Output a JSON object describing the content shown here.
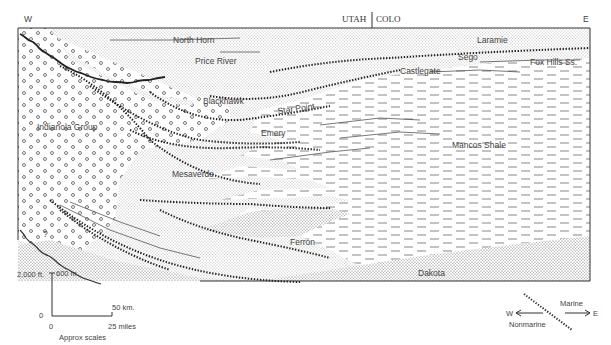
{
  "figure": {
    "type": "geologic-cross-section",
    "orientation": {
      "west_label": "W",
      "east_label": "E"
    },
    "state_boundary": {
      "left": "UTAH",
      "right": "COLO"
    }
  },
  "units": [
    {
      "name": "North Horn",
      "lithology": "sandstone-fine"
    },
    {
      "name": "Price River",
      "lithology": "sandstone-fine"
    },
    {
      "name": "Laramie",
      "lithology": "sandstone-fine"
    },
    {
      "name": "Sego",
      "lithology": "sandstone"
    },
    {
      "name": "Fox Hills Ss.",
      "lithology": "sandstone"
    },
    {
      "name": "Castlegate",
      "lithology": "sandstone"
    },
    {
      "name": "Blackhawk",
      "lithology": "sandstone"
    },
    {
      "name": "Star Point",
      "lithology": "sandstone"
    },
    {
      "name": "Emery",
      "lithology": "sandstone"
    },
    {
      "name": "Indianola Group",
      "lithology": "conglomerate"
    },
    {
      "name": "Mesaverde",
      "lithology": "sandstone"
    },
    {
      "name": "Mancos Shale",
      "lithology": "shale"
    },
    {
      "name": "Ferron",
      "lithology": "sandstone"
    },
    {
      "name": "Dakota",
      "lithology": "sandstone"
    }
  ],
  "scale": {
    "vertical_ft": "2,000 ft.",
    "vertical_m": "600 m.",
    "zero": "0",
    "horizontal_km": "50 km.",
    "horizontal_miles": "25 miles",
    "origin_x": "0",
    "caption": "Approx scales"
  },
  "legend": {
    "marine": "Marine",
    "nonmarine": "Nonmarine",
    "west": "W",
    "east": "E"
  },
  "uncertain_marker": "?"
}
